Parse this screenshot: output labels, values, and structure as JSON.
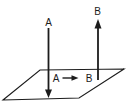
{
  "figure": {
    "background_color": "#ffffff",
    "ink_color": "#1c1c1c",
    "plane": {
      "shape": "parallelogram"
    },
    "labels": {
      "vector_a_top": "A",
      "vector_b_top": "B",
      "mapping_a": "A",
      "mapping_b": "B"
    }
  }
}
